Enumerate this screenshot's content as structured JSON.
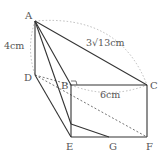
{
  "figure": {
    "type": "geometry-solid",
    "colors": {
      "line": "#333333",
      "dashed": "#999999",
      "text": "#555555"
    },
    "points": {
      "A": {
        "label": "A",
        "x": 35,
        "y": 21
      },
      "B": {
        "label": "B",
        "x": 71,
        "y": 85
      },
      "C": {
        "label": "C",
        "x": 147,
        "y": 85
      },
      "D": {
        "label": "D",
        "x": 35,
        "y": 75
      },
      "E": {
        "label": "E",
        "x": 71,
        "y": 137
      },
      "F": {
        "label": "F",
        "x": 147,
        "y": 137
      },
      "G": {
        "label": "G",
        "x": 109,
        "y": 137
      }
    },
    "dimensions": {
      "AD": "4cm",
      "AC": "3√13cm",
      "BC": "6cm"
    },
    "right_angle_marker": "B"
  }
}
